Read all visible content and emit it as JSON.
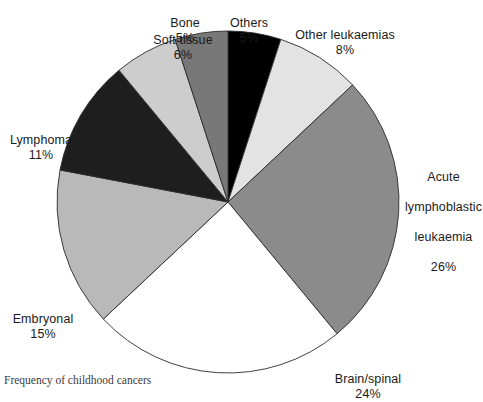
{
  "caption": "Frequency of childhood cancers",
  "chart_data": {
    "type": "pie",
    "title": "Frequency of childhood cancers",
    "units": "percent",
    "total": 100,
    "start_angle_deg": 0,
    "direction": "clockwise",
    "legend": "none (labels placed around pie)",
    "grid": false,
    "categories": [
      "Others",
      "Other leukaemias",
      "Acute lymphoblastic leukaemia",
      "Brain/spinal",
      "Embryonal",
      "Lymphoma",
      "Soft tissue",
      "Bone"
    ],
    "values": [
      5,
      8,
      26,
      24,
      15,
      11,
      6,
      5
    ],
    "slices": [
      {
        "label": "Others",
        "label_lines": [
          "Others"
        ],
        "value": 5,
        "percent_text": "5%",
        "color": "#000000",
        "start_deg": 0,
        "end_deg": 18
      },
      {
        "label": "Other leukaemias",
        "label_lines": [
          "Other leukaemias"
        ],
        "value": 8,
        "percent_text": "8%",
        "color": "#e3e3e3",
        "start_deg": 18,
        "end_deg": 46.8
      },
      {
        "label": "Acute lymphoblastic leukaemia",
        "label_lines": [
          "Acute",
          "lymphoblastic",
          "leukaemia"
        ],
        "value": 26,
        "percent_text": "26%",
        "color": "#8b8b8b",
        "start_deg": 46.8,
        "end_deg": 140.4
      },
      {
        "label": "Brain/spinal",
        "label_lines": [
          "Brain/spinal"
        ],
        "value": 24,
        "percent_text": "24%",
        "color": "#ffffff",
        "start_deg": 140.4,
        "end_deg": 226.8
      },
      {
        "label": "Embryonal",
        "label_lines": [
          "Embryonal"
        ],
        "value": 15,
        "percent_text": "15%",
        "color": "#b9b9b9",
        "start_deg": 226.8,
        "end_deg": 280.8
      },
      {
        "label": "Lymphoma",
        "label_lines": [
          "Lymphoma"
        ],
        "value": 11,
        "percent_text": "11%",
        "color": "#1e1e1e",
        "start_deg": 280.8,
        "end_deg": 320.4
      },
      {
        "label": "Soft tissue",
        "label_lines": [
          "Soft tissue"
        ],
        "value": 6,
        "percent_text": "6%",
        "color": "#cdcdcd",
        "start_deg": 320.4,
        "end_deg": 342
      },
      {
        "label": "Bone",
        "label_lines": [
          "Bone"
        ],
        "value": 5,
        "percent_text": "5%",
        "color": "#787878",
        "start_deg": 342,
        "end_deg": 360
      }
    ]
  },
  "labels": {
    "others": {
      "name": "Others",
      "pct": "5%"
    },
    "other_leukaemias": {
      "name": "Other leukaemias",
      "pct": "8%"
    },
    "all_line1": {
      "text": "Acute"
    },
    "all_line2": {
      "text": "lymphoblastic"
    },
    "all_line3": {
      "text": "leukaemia"
    },
    "all_pct": {
      "text": "26%"
    },
    "brain_spinal": {
      "name": "Brain/spinal",
      "pct": "24%"
    },
    "embryonal": {
      "name": "Embryonal",
      "pct": "15%"
    },
    "lymphoma": {
      "name": "Lymphoma",
      "pct": "11%"
    },
    "soft_tissue": {
      "name": "Soft tissue",
      "pct": "6%"
    },
    "bone": {
      "name": "Bone",
      "pct": "5%"
    }
  },
  "geometry": {
    "center_x": 228,
    "center_y": 202,
    "radius": 171,
    "outline_color": "#2b2b2b"
  }
}
